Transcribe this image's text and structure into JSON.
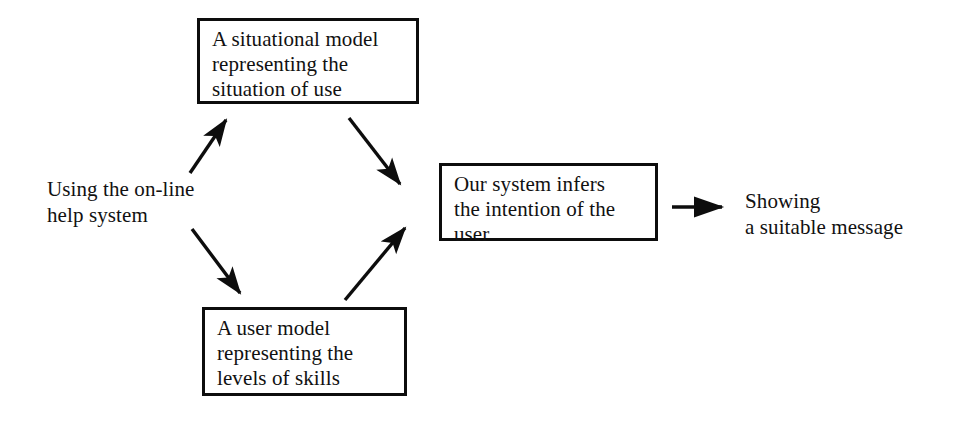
{
  "diagram": {
    "background_color": "#ffffff",
    "stroke_color": "#0d0d0d",
    "text_color": "#111111",
    "nodes": [
      {
        "id": "entry_point",
        "kind": "label",
        "text": "Using the on-line\nhelp system"
      },
      {
        "id": "situational_model",
        "kind": "box",
        "text": "A situational model\nrepresenting the\nsituation of use"
      },
      {
        "id": "user_model",
        "kind": "box",
        "text": "A user model\nrepresenting the\nlevels of skills"
      },
      {
        "id": "inference_engine",
        "kind": "box",
        "text": "Our system infers\nthe intention of the\nuser"
      },
      {
        "id": "outcome",
        "kind": "label",
        "text": "Showing\na suitable message"
      }
    ],
    "edges": [
      {
        "id": "entry-to-situational",
        "from": "entry_point",
        "to": "situational_model",
        "direction": "up-right",
        "label": ""
      },
      {
        "id": "entry-to-user",
        "from": "entry_point",
        "to": "user_model",
        "direction": "down-right",
        "label": ""
      },
      {
        "id": "situational-to-inference",
        "from": "situational_model",
        "to": "inference_engine",
        "direction": "down-right",
        "label": ""
      },
      {
        "id": "user-to-inference",
        "from": "user_model",
        "to": "inference_engine",
        "direction": "up-right",
        "label": ""
      },
      {
        "id": "inference-to-outcome",
        "from": "inference_engine",
        "to": "outcome",
        "direction": "right",
        "label": ""
      }
    ]
  }
}
